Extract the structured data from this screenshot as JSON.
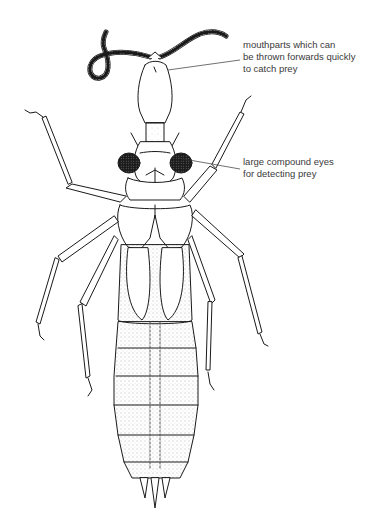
{
  "figure": {
    "background_color": "#ffffff",
    "line_color": "#1a1a1a",
    "stipple_color": "#555555"
  },
  "annotations": [
    {
      "id": "mouthparts",
      "lines": [
        "mouthparts which can",
        "be thrown forwards quickly",
        "to catch prey"
      ],
      "pointer": {
        "from": [
          240,
          60
        ],
        "to": [
          168,
          70
        ]
      }
    },
    {
      "id": "eyes",
      "lines": [
        "large compound eyes",
        "for detecting prey"
      ],
      "pointer": {
        "from": [
          240,
          169
        ],
        "to": [
          178,
          158
        ]
      }
    }
  ]
}
